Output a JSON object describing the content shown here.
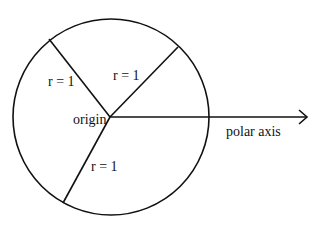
{
  "diagram": {
    "title": "",
    "labels": {
      "radius_upper_left": "r = 1",
      "radius_upper_right": "r = 1",
      "radius_lower": "r = 1",
      "origin": "origin",
      "polar_axis": "polar axis"
    },
    "geometry": {
      "circle_center": [
        111,
        117
      ],
      "circle_radius": 98,
      "radii_endpoints": [
        [
          49,
          39
        ],
        [
          178,
          47
        ],
        [
          63,
          203
        ]
      ],
      "polar_axis_end": [
        307,
        117
      ]
    },
    "colors": {
      "stroke": "#111111",
      "background": "#ffffff"
    }
  }
}
